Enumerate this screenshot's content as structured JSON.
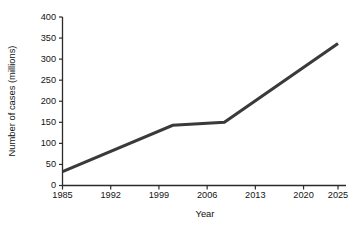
{
  "chart_data": {
    "type": "line",
    "title": "",
    "xlabel": "Year",
    "ylabel": "Number of cases (millions)",
    "xlim": [
      1985,
      2025
    ],
    "ylim": [
      0,
      400
    ],
    "grid": false,
    "legend": null,
    "legend_position": "none",
    "x_ticks": [
      1985,
      1992,
      1999,
      2006,
      2013,
      2020,
      2025
    ],
    "x_tick_labels": [
      "1985",
      "1992",
      "1999",
      "2006",
      "2013",
      "2020",
      "2025"
    ],
    "y_ticks": [
      0,
      50,
      100,
      150,
      200,
      250,
      300,
      350,
      400
    ],
    "y_tick_labels": [
      "0",
      "50",
      "100",
      "150",
      "200",
      "250",
      "300",
      "350",
      "400"
    ],
    "series": [
      {
        "name": "Number of cases",
        "color": "#3a3a3a",
        "x": [
          1985,
          2001,
          2008.5,
          2025
        ],
        "values": [
          33,
          143,
          150,
          337
        ]
      }
    ],
    "annotations": []
  },
  "axis_titles": {
    "x": "Year",
    "y": "Number of cases (millions)"
  }
}
